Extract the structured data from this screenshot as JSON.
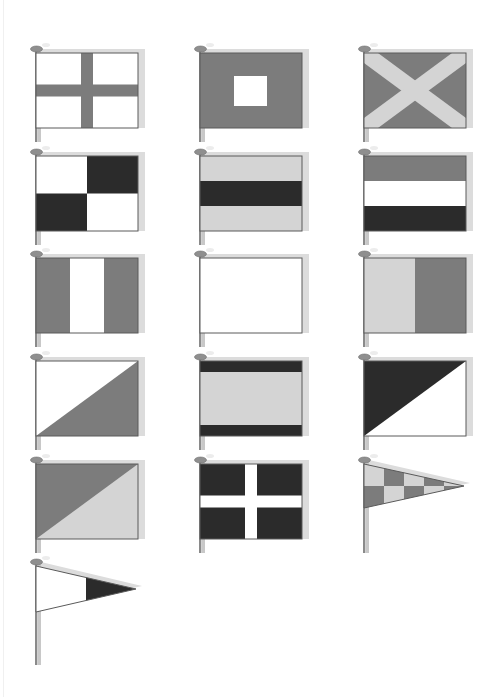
{
  "page": {
    "background": "#ffffff",
    "width": 501,
    "height": 697
  },
  "colors": {
    "white": "#ffffff",
    "light": "#d4d4d4",
    "mid": "#7c7c7c",
    "dark": "#2b2b2b",
    "outline": "#5a5a5a",
    "shadow": "#dcdcdc",
    "pole": "#8a8a8a",
    "pole_light": "#c8c8c8",
    "finial": "#8f8f8f"
  },
  "flags": [
    {
      "id": "r1c1",
      "x": 36,
      "y": 55,
      "pattern": "cross",
      "bg": "white",
      "fg": "mid",
      "pole_len": 85
    },
    {
      "id": "r1c2",
      "x": 200,
      "y": 55,
      "pattern": "center-square",
      "bg": "mid",
      "fg": "white",
      "pole_len": 85
    },
    {
      "id": "r1c3",
      "x": 364,
      "y": 55,
      "pattern": "saltire",
      "bg": "mid",
      "fg": "light",
      "pole_len": 85
    },
    {
      "id": "r2c1",
      "x": 36,
      "y": 158,
      "pattern": "quartered",
      "bg": "white",
      "fg": "dark",
      "pole_len": 85
    },
    {
      "id": "r2c2",
      "x": 200,
      "y": 158,
      "pattern": "h-band-center",
      "bg": "light",
      "fg": "dark",
      "pole_len": 85
    },
    {
      "id": "r2c3",
      "x": 364,
      "y": 158,
      "pattern": "h-tricolor",
      "bands": [
        "mid",
        "white",
        "dark"
      ],
      "pole_len": 85
    },
    {
      "id": "r3c1",
      "x": 36,
      "y": 260,
      "pattern": "v-tricolor",
      "bands": [
        "mid",
        "white",
        "mid"
      ],
      "pole_len": 85
    },
    {
      "id": "r3c2",
      "x": 200,
      "y": 260,
      "pattern": "solid",
      "bg": "white",
      "pole_len": 85
    },
    {
      "id": "r3c3",
      "x": 364,
      "y": 260,
      "pattern": "v-bicolor",
      "bands": [
        "light",
        "mid"
      ],
      "pole_len": 85
    },
    {
      "id": "r4c1",
      "x": 36,
      "y": 363,
      "pattern": "diag-lower-right",
      "bg": "white",
      "fg": "mid",
      "pole_len": 85
    },
    {
      "id": "r4c2",
      "x": 200,
      "y": 363,
      "pattern": "h-border-bands",
      "bg": "light",
      "fg": "dark",
      "pole_len": 85
    },
    {
      "id": "r4c3",
      "x": 364,
      "y": 363,
      "pattern": "diag-upper-left",
      "bg": "white",
      "fg": "dark",
      "pole_len": 85
    },
    {
      "id": "r5c1",
      "x": 36,
      "y": 466,
      "pattern": "diag-upper-left",
      "bg": "light",
      "fg": "mid",
      "pole_len": 85
    },
    {
      "id": "r5c2",
      "x": 200,
      "y": 466,
      "pattern": "cross",
      "bg": "dark",
      "fg": "white",
      "pole_len": 85
    },
    {
      "id": "r5c3",
      "x": 364,
      "y": 466,
      "pattern": "pennant-checker",
      "a": "light",
      "b": "mid",
      "pole_len": 85
    },
    {
      "id": "r6c1",
      "x": 36,
      "y": 568,
      "pattern": "pennant-tip",
      "bg": "white",
      "fg": "dark",
      "pole_len": 95
    }
  ]
}
